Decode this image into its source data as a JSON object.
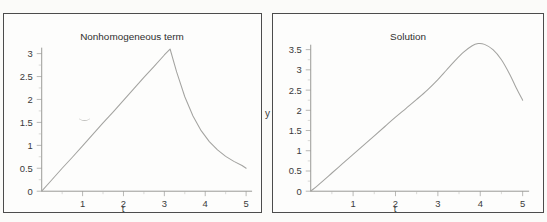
{
  "figure": {
    "background_color": "#fbfbf9",
    "panel_background": "#fdfdfc",
    "border_color": "#4c4c4c",
    "curve_color": "#a3a3a0",
    "axis_color": "#8d8d8a",
    "text_color": "#3a3a3a"
  },
  "chart_data": [
    {
      "type": "line",
      "panel": "left",
      "title": "Nonhomogeneous term",
      "xlabel": "t",
      "ylabel": "",
      "xlim": [
        0,
        5.15
      ],
      "ylim": [
        0,
        3.3
      ],
      "grid": false,
      "legend": "none",
      "xticks": [
        1,
        2,
        3,
        4,
        5
      ],
      "xtick_labels": [
        "1",
        "2",
        "3",
        "4",
        "5"
      ],
      "yticks": [
        0,
        0.5,
        1,
        1.5,
        2,
        2.5,
        3
      ],
      "ytick_labels": [
        "0",
        "0.5",
        "1",
        "1.5",
        "2",
        "2.5",
        "3"
      ],
      "description": "Linear ramp from origin to a peak then exponential decay",
      "x": [
        0,
        0.25,
        0.5,
        0.75,
        1,
        1.25,
        1.5,
        1.75,
        2,
        2.25,
        2.5,
        2.75,
        3,
        3.14,
        3.3,
        3.5,
        3.7,
        3.9,
        4.1,
        4.3,
        4.5,
        4.7,
        4.9,
        5
      ],
      "y": [
        0,
        0.25,
        0.5,
        0.74,
        0.99,
        1.24,
        1.49,
        1.73,
        1.98,
        2.23,
        2.48,
        2.72,
        2.97,
        3.1,
        2.6,
        2.06,
        1.64,
        1.32,
        1.08,
        0.9,
        0.76,
        0.65,
        0.56,
        0.5
      ]
    },
    {
      "type": "line",
      "panel": "right",
      "title": "Solution",
      "xlabel": "t",
      "ylabel": "y",
      "xlim": [
        0,
        5.15
      ],
      "ylim": [
        0,
        3.85
      ],
      "grid": false,
      "legend": "none",
      "xticks": [
        1,
        2,
        3,
        4,
        5
      ],
      "xtick_labels": [
        "1",
        "2",
        "3",
        "4",
        "5"
      ],
      "yticks": [
        0,
        0.5,
        1,
        1.5,
        2,
        2.5,
        3,
        3.5
      ],
      "ytick_labels": [
        "0",
        "0.5",
        "1",
        "1.5",
        "2",
        "2.5",
        "3",
        "3.5"
      ],
      "description": "Smooth rise to a rounded maximum near t=3.9 then decline",
      "x": [
        0,
        0.25,
        0.5,
        0.75,
        1,
        1.25,
        1.5,
        1.75,
        2,
        2.25,
        2.5,
        2.75,
        3,
        3.2,
        3.4,
        3.6,
        3.8,
        3.95,
        4.1,
        4.3,
        4.5,
        4.7,
        4.85,
        5
      ],
      "y": [
        0,
        0.22,
        0.45,
        0.68,
        0.91,
        1.14,
        1.37,
        1.6,
        1.83,
        2.05,
        2.27,
        2.5,
        2.76,
        2.99,
        3.22,
        3.43,
        3.59,
        3.65,
        3.63,
        3.5,
        3.25,
        2.88,
        2.55,
        2.25
      ]
    }
  ]
}
